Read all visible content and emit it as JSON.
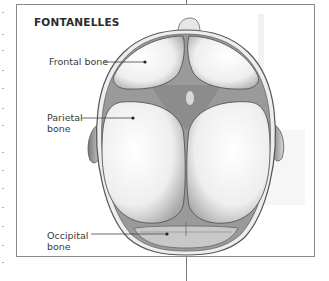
{
  "figure": {
    "title": "FONTANELLES",
    "labels": {
      "frontal": "Frontal bone",
      "parietal_line1": "Parietal",
      "parietal_line2": "bone",
      "occipital_line1": "Occipital",
      "occipital_line2": "bone"
    },
    "colors": {
      "frame": "#8a8a8a",
      "ink": "#3a3a3a",
      "skull_outline": "#5a5a5a",
      "bone_fill": "#f4f4f4",
      "fontanelle_fill": "#8c8c8c"
    }
  }
}
